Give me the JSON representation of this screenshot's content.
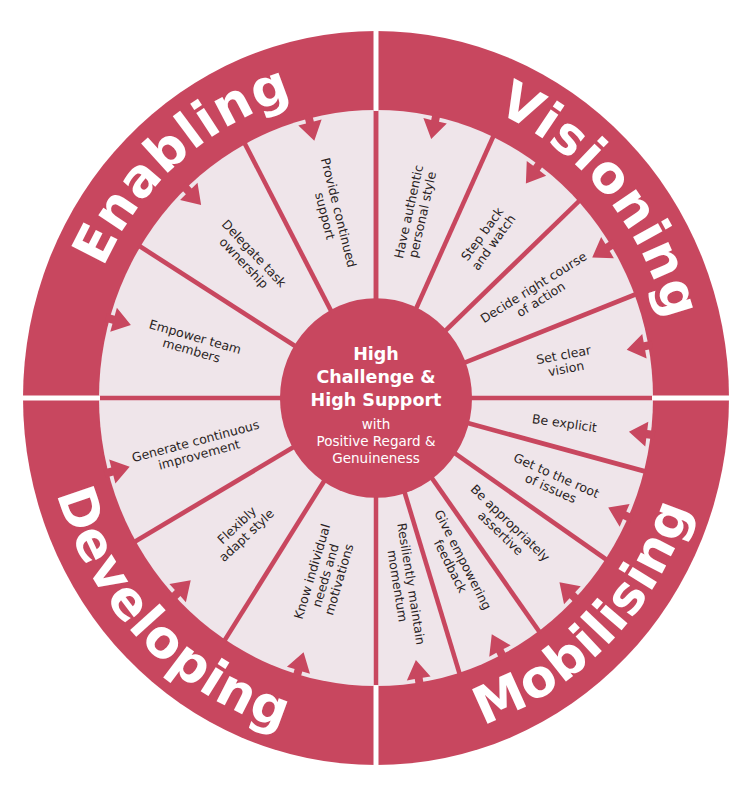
{
  "colors": {
    "primary": "#c8475f",
    "ring_fill": "#efe5ea",
    "background": "#ffffff",
    "label_text": "#2a1f24",
    "divider": "#ffffff"
  },
  "center": {
    "title_lines": [
      "High",
      "Challenge &",
      "High Support"
    ],
    "subtitle_lines": [
      "with",
      "Positive Regard &",
      "Genuineness"
    ]
  },
  "quadrants": [
    {
      "name": "Enabling",
      "position": "top-left",
      "items": [
        "Empower team members",
        "Delegate task ownership",
        "Provide continued support"
      ]
    },
    {
      "name": "Visioning",
      "position": "top-right",
      "items": [
        "Have authentic personal style",
        "Step back and watch",
        "Decide right course of action",
        "Set clear vision"
      ]
    },
    {
      "name": "Mobilising",
      "position": "bottom-right",
      "items": [
        "Be explicit",
        "Get to the root of issues",
        "Be appropriately assertive",
        "Give empowering feedback",
        "Resiliently maintain momentum"
      ]
    },
    {
      "name": "Developing",
      "position": "bottom-left",
      "items": [
        "Know individual needs and motivations",
        "Flexibly adapt style",
        "Generate continuous improvement"
      ]
    }
  ],
  "segments": [
    {
      "quadrant": "Visioning",
      "lines": [
        "Have authentic",
        "personal style"
      ],
      "mid_angle": -77.5,
      "text_rotate": -77.5,
      "r": 182
    },
    {
      "quadrant": "Visioning",
      "lines": [
        "Step back",
        "and watch"
      ],
      "mid_angle": -54,
      "text_rotate": -54,
      "r": 190
    },
    {
      "quadrant": "Visioning",
      "lines": [
        "Decide right course",
        "of action"
      ],
      "mid_angle": -32,
      "text_rotate": -32,
      "r": 190
    },
    {
      "quadrant": "Visioning",
      "lines": [
        "Set clear",
        "vision"
      ],
      "mid_angle": -10.5,
      "text_rotate": -10.5,
      "r": 192
    },
    {
      "quadrant": "Mobilising",
      "lines": [
        "Be explicit"
      ],
      "mid_angle": 7.3,
      "text_rotate": 8,
      "r": 190
    },
    {
      "quadrant": "Mobilising",
      "lines": [
        "Get to the root",
        "of issues"
      ],
      "mid_angle": 24.4,
      "text_rotate": 24,
      "r": 195
    },
    {
      "quadrant": "Mobilising",
      "lines": [
        "Be appropriately",
        "assertive"
      ],
      "mid_angle": 44,
      "text_rotate": 44,
      "r": 180
    },
    {
      "quadrant": "Mobilising",
      "lines": [
        "Give empowering",
        "feedback"
      ],
      "mid_angle": 63,
      "text_rotate": 63,
      "r": 178
    },
    {
      "quadrant": "Mobilising",
      "lines": [
        "Resiliently maintain",
        "momentum"
      ],
      "mid_angle": 81,
      "text_rotate": 81,
      "r": 182
    },
    {
      "quadrant": "Developing",
      "lines": [
        "Know individual",
        "needs and",
        "motivations"
      ],
      "mid_angle": 106.5,
      "text_rotate": -73.5,
      "r": 178
    },
    {
      "quadrant": "Developing",
      "lines": [
        "Flexibly",
        "adapt style"
      ],
      "mid_angle": 136.6,
      "text_rotate": -43.4,
      "r": 185
    },
    {
      "quadrant": "Developing",
      "lines": [
        "Generate continuous",
        "improvement"
      ],
      "mid_angle": 165,
      "text_rotate": -15,
      "r": 185
    },
    {
      "quadrant": "Enabling",
      "lines": [
        "Empower team",
        "members"
      ],
      "mid_angle": 196,
      "text_rotate": 16,
      "r": 190
    },
    {
      "quadrant": "Enabling",
      "lines": [
        "Delegate task",
        "ownership"
      ],
      "mid_angle": 226.7,
      "text_rotate": 46.7,
      "r": 185
    },
    {
      "quadrant": "Enabling",
      "lines": [
        "Provide continued",
        "support"
      ],
      "mid_angle": 256,
      "text_rotate": 76,
      "r": 182
    }
  ],
  "spoke_angles": [
    -90,
    -65,
    -43,
    -21,
    0,
    14.7,
    34,
    54,
    72.5,
    90,
    123,
    150.2,
    180,
    211.7,
    241.8,
    270
  ],
  "quadrant_labels": [
    {
      "text": "Enabling",
      "start": 197,
      "end": 262,
      "dir": "cw"
    },
    {
      "text": "Visioning",
      "start": -73,
      "end": -8,
      "dir": "cw"
    },
    {
      "text": "Mobilising",
      "start": 78,
      "end": 12,
      "dir": "ccw"
    },
    {
      "text": "Developing",
      "start": 170,
      "end": 100,
      "dir": "ccw"
    }
  ]
}
